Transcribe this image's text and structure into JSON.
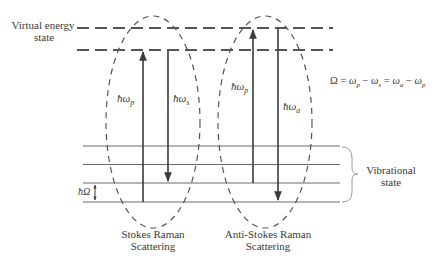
{
  "labels": {
    "virtual_state_line1": "Virtual energy",
    "virtual_state_line2": "state",
    "omega_equation": "Ω = ω_p − ω_s = ω_a − ω_p",
    "vibrational_line1": "Vibrational",
    "vibrational_line2": "state",
    "hbar_omega_spacing": "ħΩ",
    "stokes_line1": "Stokes Raman",
    "stokes_line2": "Scattering",
    "antistokes_line1": "Anti-Stokes Raman",
    "antistokes_line2": "Scattering"
  },
  "arrows": {
    "stokes_pump": "ħω_p",
    "stokes_scattered": "ħω_s",
    "antistokes_pump": "ħω_p",
    "antistokes_scattered": "ħω_a"
  },
  "colors": {
    "line": "#3a3a3a",
    "dashed": "#555555",
    "vib_line": "#6a6a6a",
    "brace": "#9a9a9a"
  },
  "levels": {
    "virtual_y": [
      28,
      50
    ],
    "vibrational_y": [
      146,
      164.5,
      183,
      202
    ]
  }
}
